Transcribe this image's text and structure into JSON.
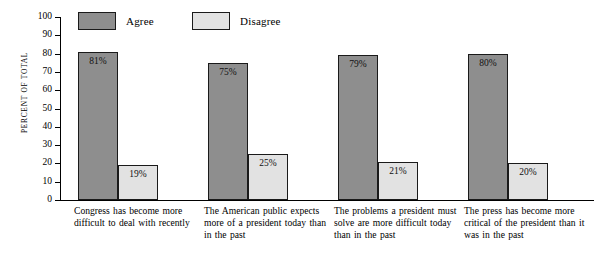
{
  "chart_data": {
    "type": "bar",
    "title": "",
    "subtitle": "",
    "xlabel": "",
    "ylabel": "PERCENT OF TOTAL",
    "ylim": [
      0,
      100
    ],
    "ytick_step": 10,
    "yticks": [
      100,
      90,
      80,
      70,
      60,
      50,
      40,
      30,
      20,
      10,
      0
    ],
    "grid": false,
    "legend_position": "top-left",
    "value_label_suffix": "%",
    "categories": [
      "Congress has become more difficult to deal with recently",
      "The American public expects more of a president today than in the past",
      "The problems a president must solve are more difficult today than in the past",
      "The press has become more critical of the president than it was in the past"
    ],
    "series": [
      {
        "name": "Agree",
        "color": "#8e8e8e",
        "values": [
          81,
          75,
          79,
          80
        ],
        "value_labels": [
          "81%",
          "75%",
          "79%",
          "80%"
        ]
      },
      {
        "name": "Disagree",
        "color": "#e2e2e2",
        "values": [
          19,
          25,
          21,
          20
        ],
        "value_labels": [
          "19%",
          "25%",
          "21%",
          "20%"
        ]
      }
    ]
  },
  "axis": {
    "y_title": "PERCENT OF TOTAL",
    "y_tick_labels": [
      "100",
      "90",
      "80",
      "70",
      "60",
      "50",
      "40",
      "30",
      "20",
      "10",
      "0"
    ]
  },
  "legend": {
    "items": [
      {
        "label": "Agree",
        "color": "#8e8e8e"
      },
      {
        "label": "Disagree",
        "color": "#e2e2e2"
      }
    ]
  },
  "captions": [
    "Congress has become more difficult to deal with recently",
    "The American public expects more of a president today than in the past",
    "The problems a president must solve are more difficult today than in the past",
    "The press has become more critical of the president than it was in the past"
  ]
}
